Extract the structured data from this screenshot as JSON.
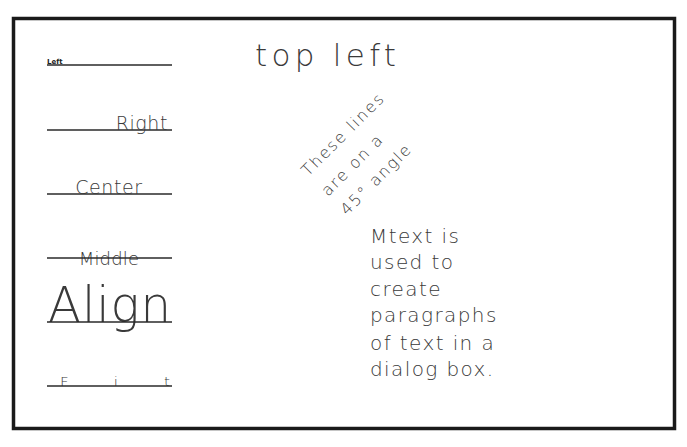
{
  "drawing": {
    "frame": {
      "x": 13,
      "y": 18,
      "width": 662,
      "height": 410,
      "color": "#1a1a1a"
    },
    "justification_samples": [
      {
        "name": "left",
        "label": "Left",
        "mode": "left",
        "line_y": 65
      },
      {
        "name": "right",
        "label": "Right",
        "mode": "right",
        "line_y": 130
      },
      {
        "name": "center",
        "label": "Center",
        "mode": "center",
        "line_y": 194
      },
      {
        "name": "middle",
        "label": "Middle",
        "mode": "middle",
        "line_y": 258
      },
      {
        "name": "align",
        "label": "Align",
        "mode": "align",
        "line_y": 322
      },
      {
        "name": "fit",
        "label": "Fit",
        "mode": "fit",
        "line_y": 386
      }
    ],
    "top_left_text": "top left",
    "angled_text": {
      "angle_degrees": 45,
      "lines": [
        "These lines",
        "are on a",
        "45° angle"
      ]
    },
    "mtext": {
      "lines": [
        "Mtext is",
        "used to",
        "create",
        "paragraphs",
        "of text in a",
        "dialog box."
      ]
    }
  }
}
